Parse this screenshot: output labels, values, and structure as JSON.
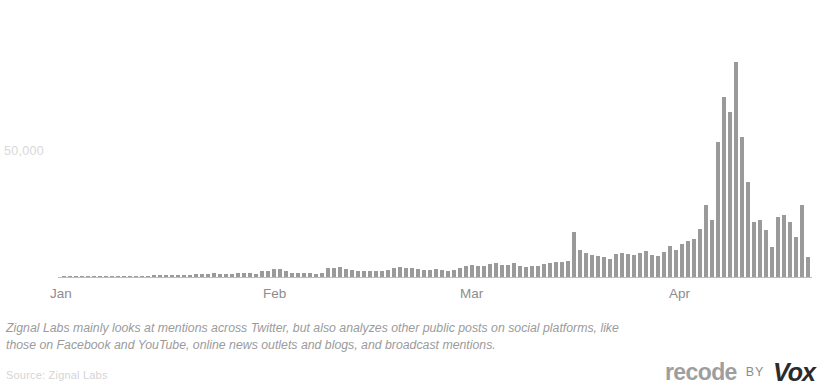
{
  "chart_data": {
    "type": "bar",
    "title": "",
    "subtitle": "",
    "xlabel": "",
    "ylabel": "",
    "grid": false,
    "legend": null,
    "ytick_labels": [
      "50,000"
    ],
    "ytick_values": [
      50000
    ],
    "ylim": [
      0,
      90000
    ],
    "xtick_labels": [
      "Jan",
      "Feb",
      "Mar",
      "Apr"
    ],
    "xtick_positions": [
      0,
      31,
      60,
      91
    ],
    "bar_color": "#9a9a9a",
    "axis_color": "#bdbdbd",
    "annotations": [],
    "categories": [
      "Jan 1",
      "Jan 2",
      "Jan 3",
      "Jan 4",
      "Jan 5",
      "Jan 6",
      "Jan 7",
      "Jan 8",
      "Jan 9",
      "Jan 10",
      "Jan 11",
      "Jan 12",
      "Jan 13",
      "Jan 14",
      "Jan 15",
      "Jan 16",
      "Jan 17",
      "Jan 18",
      "Jan 19",
      "Jan 20",
      "Jan 21",
      "Jan 22",
      "Jan 23",
      "Jan 24",
      "Jan 25",
      "Jan 26",
      "Jan 27",
      "Jan 28",
      "Jan 29",
      "Jan 30",
      "Jan 31",
      "Feb 1",
      "Feb 2",
      "Feb 3",
      "Feb 4",
      "Feb 5",
      "Feb 6",
      "Feb 7",
      "Feb 8",
      "Feb 9",
      "Feb 10",
      "Feb 11",
      "Feb 12",
      "Feb 13",
      "Feb 14",
      "Feb 15",
      "Feb 16",
      "Feb 17",
      "Feb 18",
      "Feb 19",
      "Feb 20",
      "Feb 21",
      "Feb 22",
      "Feb 23",
      "Feb 24",
      "Feb 25",
      "Feb 26",
      "Feb 27",
      "Feb 28",
      "Mar 1",
      "Mar 2",
      "Mar 3",
      "Mar 4",
      "Mar 5",
      "Mar 6",
      "Mar 7",
      "Mar 8",
      "Mar 9",
      "Mar 10",
      "Mar 11",
      "Mar 12",
      "Mar 13",
      "Mar 14",
      "Mar 15",
      "Mar 16",
      "Mar 17",
      "Mar 18",
      "Mar 19",
      "Mar 20",
      "Mar 21",
      "Mar 22",
      "Mar 23",
      "Mar 24",
      "Mar 25",
      "Mar 26",
      "Mar 27",
      "Mar 28",
      "Mar 29",
      "Mar 30",
      "Mar 31",
      "Apr 1",
      "Apr 2",
      "Apr 3",
      "Apr 4",
      "Apr 5",
      "Apr 6",
      "Apr 7",
      "Apr 8",
      "Apr 9",
      "Apr 10",
      "Apr 11",
      "Apr 12",
      "Apr 13",
      "Apr 14",
      "Apr 15",
      "Apr 16",
      "Apr 17",
      "Apr 18",
      "Apr 19",
      "Apr 20",
      "Apr 21",
      "Apr 22",
      "Apr 23",
      "Apr 24",
      "Apr 25",
      "Apr 26",
      "Apr 27",
      "Apr 28",
      "Apr 29",
      "Apr 30",
      "May 1",
      "May 2",
      "May 3",
      "May 4",
      "May 5"
    ],
    "values": [
      300,
      300,
      300,
      300,
      300,
      400,
      400,
      400,
      400,
      500,
      500,
      500,
      600,
      600,
      600,
      700,
      700,
      800,
      800,
      900,
      900,
      1000,
      1200,
      1300,
      1400,
      1600,
      1200,
      1100,
      1400,
      1600,
      1800,
      1500,
      1300,
      2600,
      2600,
      3200,
      3400,
      2400,
      1800,
      1600,
      1500,
      1500,
      1400,
      1600,
      3600,
      3800,
      4000,
      3400,
      2800,
      2400,
      2400,
      2400,
      2400,
      2600,
      3000,
      3600,
      4200,
      3800,
      3600,
      3200,
      3000,
      3000,
      3400,
      2800,
      2600,
      2800,
      3800,
      4400,
      5000,
      4400,
      4600,
      5200,
      5600,
      5000,
      4800,
      5600,
      4600,
      4200,
      4400,
      4600,
      5200,
      5600,
      6000,
      6200,
      6600,
      18000,
      10800,
      9600,
      9000,
      8400,
      8000,
      7400,
      9200,
      9600,
      9400,
      9000,
      9600,
      10600,
      9000,
      8600,
      10200,
      12600,
      10800,
      13200,
      14600,
      15200,
      19200,
      28800,
      23000,
      54000,
      72000,
      66000,
      86000,
      56000,
      38000,
      22000,
      23000,
      19000,
      12000,
      24000,
      25000,
      22000,
      16000,
      29000,
      8000
    ]
  },
  "axis": {
    "y_tick_label": "50,000",
    "x_ticks": [
      {
        "label": "Jan",
        "left": 50
      },
      {
        "label": "Feb",
        "left": 263
      },
      {
        "label": "Mar",
        "left": 460
      },
      {
        "label": "Apr",
        "left": 669
      }
    ]
  },
  "notes": {
    "line1": "Zignal Labs mainly looks at mentions across Twitter, but also analyzes other public posts on social platforms, like",
    "line2": "those on Facebook and YouTube, online news outlets and blogs, and broadcast mentions.",
    "source": "Source: Zignal Labs"
  },
  "logo": {
    "brand": "recode",
    "connector": "BY",
    "parent": "Vox"
  }
}
